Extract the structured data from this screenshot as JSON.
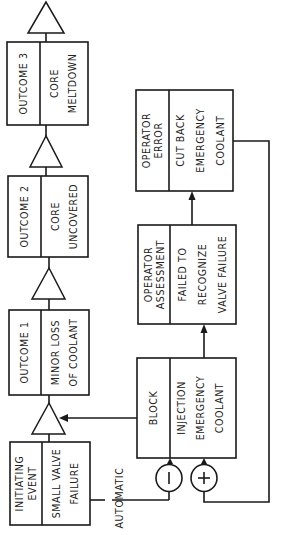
{
  "diagram": {
    "outcomes": [
      {
        "label": "OUTCOME 3",
        "description_lines": [
          "CORE",
          "MELTDOWN"
        ]
      },
      {
        "label": "OUTCOME 2",
        "description_lines": [
          "CORE",
          "UNCOVERED"
        ]
      },
      {
        "label": "OUTCOME 1",
        "description_lines": [
          "MINOR LOSS",
          "OF COOLANT"
        ]
      }
    ],
    "initiating_event": {
      "label_lines": [
        "INITIATING",
        "EVENT"
      ],
      "description_lines": [
        "SMALL VALVE",
        "FAILURE"
      ]
    },
    "automatic_label": "AUTOMATIC",
    "block_injection": {
      "label": "BLOCK",
      "description_lines": [
        "INJECTION",
        "EMERGENCY",
        "COOLANT"
      ]
    },
    "operator_assessment": {
      "label_lines": [
        "OPERATOR",
        "ASSESSMENT"
      ],
      "description_lines": [
        "FAILED TO",
        "RECOGNIZE",
        "VALVE FAILURE"
      ]
    },
    "operator_error": {
      "label_lines": [
        "OPERATOR",
        "ERROR"
      ],
      "description_lines": [
        "CUT BACK",
        "EMERGENCY",
        "COOLANT"
      ]
    },
    "signs": {
      "negative": "−",
      "positive": "+"
    },
    "colors": {
      "line": "#1a1a1a",
      "background": "#ffffff",
      "text": "#222222"
    }
  }
}
